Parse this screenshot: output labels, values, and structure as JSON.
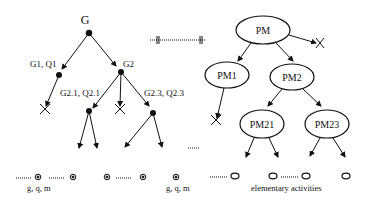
{
  "goal_tree": {
    "root": {
      "label": "G"
    },
    "nodes": [
      {
        "id": "g1",
        "label": "G1, Q1"
      },
      {
        "id": "g2",
        "label": "G2"
      },
      {
        "id": "g21",
        "label": "G2.1, Q2.1"
      },
      {
        "id": "g23",
        "label": "G2.3, Q2.3"
      }
    ],
    "leaf_labels": [
      "g, q, m",
      "g, q, m"
    ]
  },
  "process_tree": {
    "nodes": [
      {
        "id": "pm",
        "label": "PM"
      },
      {
        "id": "pm1",
        "label": "PM1"
      },
      {
        "id": "pm2",
        "label": "PM2"
      },
      {
        "id": "pm21",
        "label": "PM21"
      },
      {
        "id": "pm23",
        "label": "PM23"
      }
    ],
    "leaf_caption": "elementary activities"
  },
  "colors": {
    "stroke": "#111111",
    "background": "#ffffff"
  }
}
